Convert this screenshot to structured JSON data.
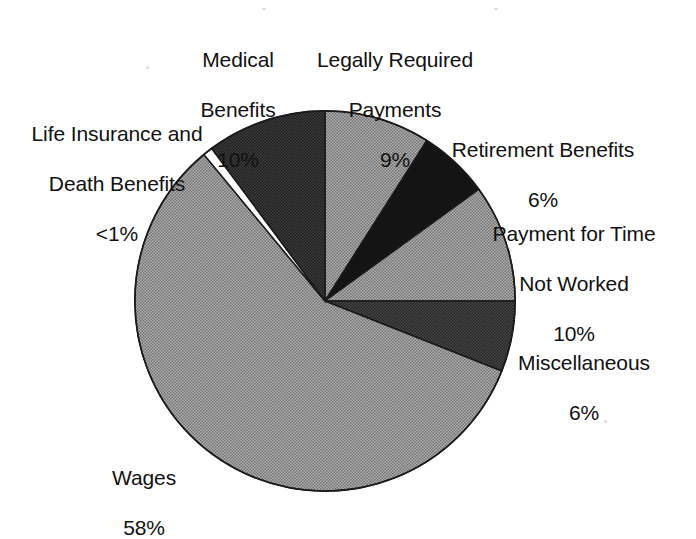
{
  "chart_data": {
    "type": "pie",
    "title": "",
    "subtitle": "",
    "xlabel": "",
    "ylabel": "",
    "legend_position": "none",
    "grid": false,
    "units": "percent",
    "start_angle_deg": 0,
    "direction": "clockwise",
    "categories": [
      "Legally Required Payments",
      "Retirement Benefits",
      "Payment for Time Not Worked",
      "Miscellaneous",
      "Wages",
      "Life Insurance and Death Benefits",
      "Medical Benefits"
    ],
    "values": [
      9,
      6,
      10,
      6,
      58,
      0.5,
      10
    ],
    "value_labels": [
      "9%",
      "6%",
      "10%",
      "6%",
      "58%",
      "<1%",
      "10%"
    ],
    "slice_colors": [
      "#9e9e9e",
      "#141414",
      "#9e9e9e",
      "#3a3a3a",
      "#9e9e9e",
      "#ffffff",
      "#303030"
    ],
    "outline_color": "#1a1a1a",
    "background_color": "#ffffff",
    "slices": [
      {
        "label": "Legally Required Payments",
        "value": 9,
        "value_label": "9%",
        "color": "#9e9e9e",
        "start_deg": 0,
        "end_deg": 32.4
      },
      {
        "label": "Retirement Benefits",
        "value": 6,
        "value_label": "6%",
        "color": "#141414",
        "start_deg": 32.4,
        "end_deg": 54.0
      },
      {
        "label": "Payment for Time Not Worked",
        "value": 10,
        "value_label": "10%",
        "color": "#9e9e9e",
        "start_deg": 54.0,
        "end_deg": 90.0
      },
      {
        "label": "Miscellaneous",
        "value": 6,
        "value_label": "6%",
        "color": "#3a3a3a",
        "start_deg": 90.0,
        "end_deg": 111.6
      },
      {
        "label": "Wages",
        "value": 58,
        "value_label": "58%",
        "color": "#9e9e9e",
        "start_deg": 111.6,
        "end_deg": 320.4
      },
      {
        "label": "Life Insurance and Death Benefits",
        "value": 0.5,
        "value_label": "<1%",
        "color": "#ffffff",
        "start_deg": 320.4,
        "end_deg": 323.4
      },
      {
        "label": "Medical Benefits",
        "value": 10,
        "value_label": "10%",
        "color": "#303030",
        "start_deg": 323.4,
        "end_deg": 360.0
      }
    ]
  },
  "labels": {
    "medical": {
      "line1": "Medical",
      "line2": "Benefits",
      "line3": "10%"
    },
    "legally": {
      "line1": "Legally Required",
      "line2": "Payments",
      "line3": "9%"
    },
    "life": {
      "line1": "Life Insurance and",
      "line2": "Death Benefits",
      "line3": "<1%"
    },
    "retirement": {
      "line1": "Retirement Benefits",
      "line2": "6%"
    },
    "paytime": {
      "line1": "Payment for Time",
      "line2": "Not Worked",
      "line3": "10%"
    },
    "misc": {
      "line1": "Miscellaneous",
      "line2": "6%"
    },
    "wages": {
      "line1": "Wages",
      "line2": "58%"
    }
  }
}
